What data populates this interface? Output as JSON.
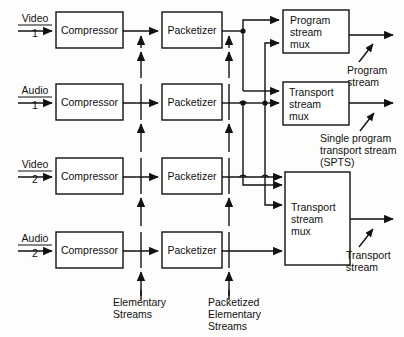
{
  "diagram": {
    "colors": {
      "stroke": "#111111",
      "box_fill": "#ffffff",
      "background": "#fdfdfc"
    },
    "inputs": [
      {
        "name": "video-1",
        "label": "Video",
        "index": "1"
      },
      {
        "name": "audio-1",
        "label": "Audio",
        "index": "1"
      },
      {
        "name": "video-2",
        "label": "Video",
        "index": "2"
      },
      {
        "name": "audio-2",
        "label": "Audio",
        "index": "2"
      }
    ],
    "compressors": [
      {
        "label": "Compressor"
      },
      {
        "label": "Compressor"
      },
      {
        "label": "Compressor"
      },
      {
        "label": "Compressor"
      }
    ],
    "packetizers": [
      {
        "label": "Packetizer"
      },
      {
        "label": "Packetizer"
      },
      {
        "label": "Packetizer"
      },
      {
        "label": "Packetizer"
      }
    ],
    "muxes": [
      {
        "name": "program-stream-mux",
        "line1": "Program",
        "line2": "stream",
        "line3": "mux"
      },
      {
        "name": "transport-stream-mux-spts",
        "line1": "Transport",
        "line2": "stream",
        "line3": "mux"
      },
      {
        "name": "transport-stream-mux",
        "line1": "Transport",
        "line2": "stream",
        "line3": "mux"
      }
    ],
    "outputs": [
      {
        "name": "program-stream-output",
        "line1": "Program",
        "line2": "stream"
      },
      {
        "name": "spts-output",
        "line1": "Single program",
        "line2": "transport stream",
        "line3": "(SPTS)"
      },
      {
        "name": "transport-stream-output",
        "line1": "Transport",
        "line2": "stream"
      }
    ],
    "captions": [
      {
        "name": "elementary-streams-caption",
        "line1": "Elementary",
        "line2": "Streams"
      },
      {
        "name": "packetized-elementary-streams-caption",
        "line1": "Packetized",
        "line2": "Elementary",
        "line3": "Streams"
      }
    ]
  }
}
